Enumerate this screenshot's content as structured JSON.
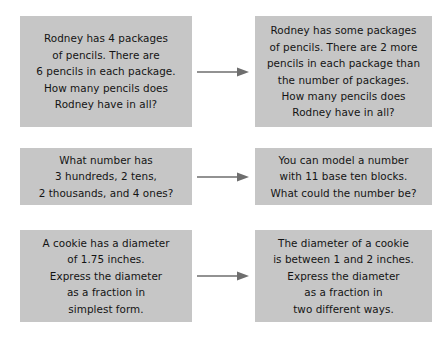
{
  "diagram": {
    "colors": {
      "box_background": "#c6c6c6",
      "text": "#141414",
      "arrow": "#6e6e6e",
      "page_background": "#ffffff"
    },
    "arrow_icon_name": "right-arrow-icon",
    "rows": [
      {
        "id": "row-1",
        "original": "Rodney has 4 packages\nof pencils. There are\n6 pencils in each package.\nHow many pencils does\nRodney have in all?",
        "arrow_label": "becomes",
        "revised": "Rodney has some packages\nof pencils. There are 2 more\npencils in each package than\nthe number of packages.\nHow many pencils does\nRodney have in all?"
      },
      {
        "id": "row-2",
        "original": "What number has\n3 hundreds, 2 tens,\n2 thousands, and 4 ones?",
        "arrow_label": "becomes",
        "revised": "You can model a number\nwith 11 base ten blocks.\nWhat could the number be?"
      },
      {
        "id": "row-3",
        "original": "A cookie has a diameter\nof 1.75 inches.\nExpress the diameter\nas a fraction in\nsimplest form.",
        "arrow_label": "becomes",
        "revised": "The diameter of a cookie\nis between 1 and 2 inches.\nExpress the diameter\nas a fraction in\ntwo different ways."
      }
    ]
  }
}
